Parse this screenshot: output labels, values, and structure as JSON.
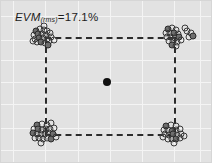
{
  "figure": {
    "title": "",
    "annotation": {
      "metric": "EVM",
      "subscript": "(rms)",
      "equals": "=",
      "value": "17.1%",
      "full_text": "EVM(rms) = 17.1%"
    },
    "background_color": "#e2e2e2",
    "grid_color": "#f4f4f4",
    "marker_color": "#3a3a3a",
    "dash_color": "#2b2b2b",
    "center_dot_color": "#101010"
  },
  "chart_data": {
    "type": "scatter",
    "title": "",
    "xlabel": "",
    "ylabel": "",
    "grid": true,
    "legend": false,
    "annotations": [
      {
        "text": "EVM(rms) = 17.1%",
        "x": 15,
        "y": 11
      }
    ],
    "xlim": [
      0,
      212
    ],
    "ylim": [
      0,
      163
    ],
    "ideal_symbols": [
      {
        "name": "top-left",
        "x": 45,
        "y": 37
      },
      {
        "name": "top-right",
        "x": 174,
        "y": 37
      },
      {
        "name": "bottom-left",
        "x": 45,
        "y": 134
      },
      {
        "name": "bottom-right",
        "x": 174,
        "y": 134
      }
    ],
    "center_point": {
      "x": 107,
      "y": 82
    },
    "reference_rectangle": {
      "left": 45,
      "right": 174,
      "top": 37,
      "bottom": 134,
      "linestyle": "dashed"
    },
    "clusters": [
      {
        "name": "top-left-cluster",
        "center": {
          "x": 45,
          "y": 37
        },
        "points": [
          {
            "x": -9,
            "y": -6
          },
          {
            "x": -5,
            "y": -8
          },
          {
            "x": -1,
            "y": -7
          },
          {
            "x": 2,
            "y": -6
          },
          {
            "x": -11,
            "y": -2
          },
          {
            "x": -7,
            "y": -3
          },
          {
            "x": -3,
            "y": -3
          },
          {
            "x": 1,
            "y": -2
          },
          {
            "x": 5,
            "y": -4
          },
          {
            "x": -10,
            "y": 2
          },
          {
            "x": -6,
            "y": 1
          },
          {
            "x": -2,
            "y": 1
          },
          {
            "x": 2,
            "y": 2
          },
          {
            "x": 6,
            "y": 0
          },
          {
            "x": -8,
            "y": 5
          },
          {
            "x": -4,
            "y": 5
          },
          {
            "x": 0,
            "y": 6
          },
          {
            "x": 4,
            "y": 4
          },
          {
            "x": 9,
            "y": 3
          },
          {
            "x": -12,
            "y": 4
          },
          {
            "x": 3,
            "y": 8
          },
          {
            "x": -1,
            "y": -11
          }
        ]
      },
      {
        "name": "top-right-cluster",
        "center": {
          "x": 174,
          "y": 37
        },
        "points": [
          {
            "x": -6,
            "y": -8
          },
          {
            "x": -2,
            "y": -9
          },
          {
            "x": 2,
            "y": -7
          },
          {
            "x": -8,
            "y": -4
          },
          {
            "x": -4,
            "y": -4
          },
          {
            "x": 0,
            "y": -4
          },
          {
            "x": 4,
            "y": -3
          },
          {
            "x": -7,
            "y": 0
          },
          {
            "x": -3,
            "y": 0
          },
          {
            "x": 1,
            "y": 1
          },
          {
            "x": 5,
            "y": 0
          },
          {
            "x": -5,
            "y": 4
          },
          {
            "x": -1,
            "y": 4
          },
          {
            "x": 3,
            "y": 5
          },
          {
            "x": 7,
            "y": 3
          },
          {
            "x": -2,
            "y": 8
          },
          {
            "x": 2,
            "y": 9
          },
          {
            "x": 13,
            "y": -6
          },
          {
            "x": 17,
            "y": -4
          },
          {
            "x": 15,
            "y": 0
          },
          {
            "x": 19,
            "y": -1
          },
          {
            "x": 11,
            "y": -9
          }
        ]
      },
      {
        "name": "bottom-left-cluster",
        "center": {
          "x": 45,
          "y": 134
        },
        "points": [
          {
            "x": -8,
            "y": -9
          },
          {
            "x": -3,
            "y": -10
          },
          {
            "x": 2,
            "y": -9
          },
          {
            "x": 6,
            "y": -11
          },
          {
            "x": -11,
            "y": -5
          },
          {
            "x": -7,
            "y": -5
          },
          {
            "x": -3,
            "y": -4
          },
          {
            "x": 1,
            "y": -5
          },
          {
            "x": 5,
            "y": -5
          },
          {
            "x": 9,
            "y": -6
          },
          {
            "x": -12,
            "y": -1
          },
          {
            "x": -8,
            "y": 0
          },
          {
            "x": -4,
            "y": 0
          },
          {
            "x": 0,
            "y": 0
          },
          {
            "x": 4,
            "y": -1
          },
          {
            "x": 8,
            "y": 0
          },
          {
            "x": -10,
            "y": 4
          },
          {
            "x": -6,
            "y": 4
          },
          {
            "x": -2,
            "y": 5
          },
          {
            "x": 2,
            "y": 4
          },
          {
            "x": 6,
            "y": 5
          },
          {
            "x": -4,
            "y": 9
          },
          {
            "x": 11,
            "y": 3
          }
        ]
      },
      {
        "name": "bottom-right-cluster",
        "center": {
          "x": 174,
          "y": 134
        },
        "points": [
          {
            "x": -8,
            "y": -8
          },
          {
            "x": -3,
            "y": -9
          },
          {
            "x": 2,
            "y": -8
          },
          {
            "x": -10,
            "y": -4
          },
          {
            "x": -6,
            "y": -4
          },
          {
            "x": -2,
            "y": -3
          },
          {
            "x": 2,
            "y": -4
          },
          {
            "x": 6,
            "y": -5
          },
          {
            "x": -9,
            "y": 0
          },
          {
            "x": -5,
            "y": 1
          },
          {
            "x": -1,
            "y": 0
          },
          {
            "x": 3,
            "y": 1
          },
          {
            "x": 7,
            "y": 0
          },
          {
            "x": -6,
            "y": 5
          },
          {
            "x": -2,
            "y": 5
          },
          {
            "x": 2,
            "y": 5
          },
          {
            "x": 6,
            "y": 4
          },
          {
            "x": 10,
            "y": 2
          },
          {
            "x": 0,
            "y": 9
          },
          {
            "x": -11,
            "y": 3
          }
        ]
      }
    ],
    "grid_vertical_x": [
      13,
      45,
      78,
      110,
      142,
      174,
      200
    ],
    "grid_horizontal_y": [
      16,
      40,
      60,
      82,
      104,
      128,
      150
    ]
  }
}
